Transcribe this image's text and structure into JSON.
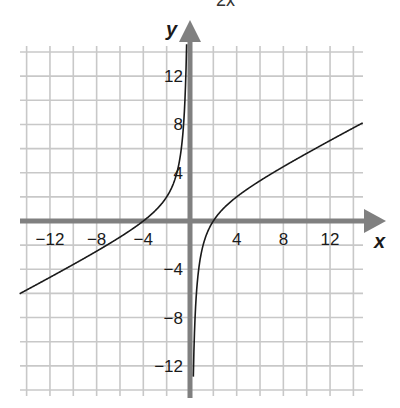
{
  "caption_fragment": "2x",
  "chart_data": {
    "type": "line",
    "title": "",
    "function": "y = (x^2 + 2x - 8) / (2x)",
    "xlabel": "x",
    "ylabel": "y",
    "xlim": [
      -15.3,
      15
    ],
    "ylim": [
      -14,
      14
    ],
    "grid": true,
    "grid_step": 2,
    "x_ticks": [
      -12,
      -8,
      -4,
      4,
      8,
      12
    ],
    "y_ticks": [
      12,
      8,
      4,
      -4,
      -8,
      -12
    ],
    "x_tick_labels": [
      "−12",
      "−8",
      "−4",
      "4",
      "8",
      "12"
    ],
    "y_tick_labels": [
      "12",
      "8",
      "4",
      "−4",
      "−8",
      "−12"
    ],
    "vertical_asymptote": 0,
    "series": [
      {
        "name": "left-branch",
        "x": [
          -14.5,
          -12,
          -8,
          -4,
          -2,
          -1,
          -0.5,
          -0.3
        ],
        "y": [
          -5.97,
          -4.67,
          -2.5,
          0,
          2,
          4.5,
          8.75,
          14.2
        ]
      },
      {
        "name": "right-branch",
        "x": [
          0.28,
          0.3,
          0.5,
          1,
          2,
          4,
          8,
          12,
          14.8
        ],
        "y": [
          -13.15,
          -12.2,
          -6.75,
          -2.5,
          0,
          2,
          4.5,
          6.67,
          8.13
        ]
      }
    ],
    "x_intercepts": [
      -4,
      2
    ]
  }
}
